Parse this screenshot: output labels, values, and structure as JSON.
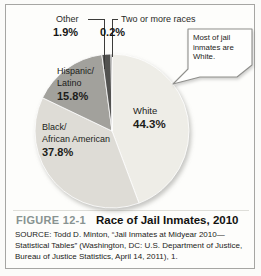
{
  "figure": {
    "label": "FIGURE 12-1",
    "title": "Race of Jail Inmates, 2010",
    "label_color": "#889391",
    "source": "SOURCE: Todd D. Minton, “Jail Inmates at Midyear 2010—Statistical Tables” (Washington, DC: U.S. Department of Justice, Bureau of Justice Statistics, April 14, 2011), 1."
  },
  "callout": {
    "lines": [
      "Most of jail",
      "inmates are",
      "White."
    ]
  },
  "chart_data": {
    "type": "pie",
    "title": "Race of Jail Inmates, 2010",
    "unit": "percent",
    "start_angle_deg": 0,
    "direction": "clockwise",
    "legend_position": "labels-on-chart",
    "slices": [
      {
        "label": "White",
        "value": 44.3,
        "display": "44.3%",
        "color": "#eeede7",
        "label_lines": [
          "White"
        ]
      },
      {
        "label": "Black/African American",
        "value": 37.8,
        "display": "37.8%",
        "color": "#dedcd6",
        "label_lines": [
          "Black/",
          "African American"
        ]
      },
      {
        "label": "Hispanic/Latino",
        "value": 15.8,
        "display": "15.8%",
        "color": "#a2a19c",
        "label_lines": [
          "Hispanic/",
          "Latino"
        ]
      },
      {
        "label": "Other",
        "value": 1.9,
        "display": "1.9%",
        "color": "#525250",
        "label_lines": [
          "Other"
        ]
      },
      {
        "label": "Two or more races",
        "value": 0.2,
        "display": "0.2%",
        "color": "#272725",
        "label_lines": [
          "Two or more races"
        ]
      }
    ]
  }
}
